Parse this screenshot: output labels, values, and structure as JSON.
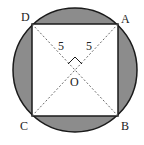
{
  "diagram": {
    "type": "geometry",
    "colors": {
      "shade": "#8c8c8c",
      "stroke": "#1a1a1a",
      "background": "#ffffff"
    },
    "labels": {
      "A": "A",
      "B": "B",
      "C": "C",
      "D": "D",
      "O": "O",
      "OD": "5",
      "OA": "5"
    },
    "right_angle_at": "O"
  }
}
